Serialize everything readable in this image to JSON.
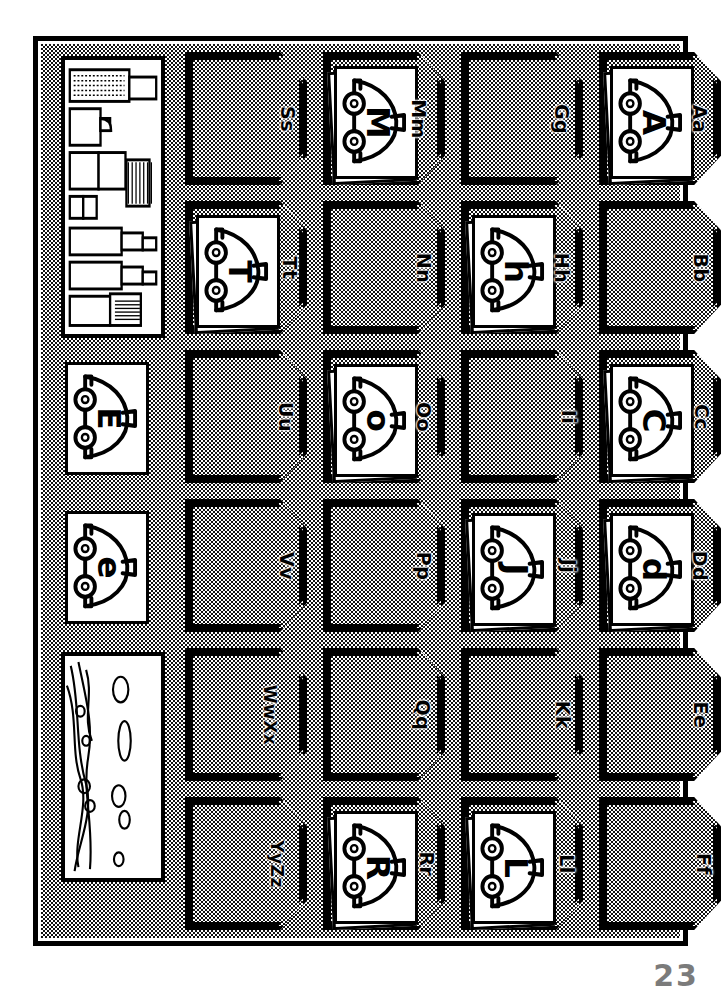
{
  "document": {
    "title": "Alphabet Pocket Chart",
    "orientation": "rotated-90",
    "page_number": "23"
  },
  "colors": {
    "ink": "#000000",
    "paper": "#ffffff",
    "felt_texture": "halftone-stipple"
  },
  "chart": {
    "rows": 6,
    "columns": 5,
    "columns_desc": [
      "illustration-column",
      "letters-S-to-Z",
      "letters-M-to-R",
      "letters-G-to-L",
      "letters-A-to-F"
    ]
  },
  "illustrations": [
    {
      "name": "bookshelf-supplies-panel",
      "position": "column-1-row-1",
      "description": "shelf with books and supplies"
    },
    {
      "name": "landscape-trees-panel",
      "position": "column-1-row-5",
      "description": "trees and bushes landscape"
    }
  ],
  "free_cards": [
    {
      "letter": "E",
      "position": "column-1-row-3"
    },
    {
      "letter": "e",
      "position": "column-1-row-4"
    }
  ],
  "pockets": [
    {
      "label": "Ss",
      "col": 4,
      "row": 1,
      "card": null
    },
    {
      "label": "Tt",
      "col": 4,
      "row": 2,
      "card": "T"
    },
    {
      "label": "Uu",
      "col": 4,
      "row": 3,
      "card": null
    },
    {
      "label": "Vv",
      "col": 4,
      "row": 4,
      "card": null
    },
    {
      "label": "WwXx",
      "col": 4,
      "row": 5,
      "card": null
    },
    {
      "label": "YyZz",
      "col": 4,
      "row": 6,
      "card": null
    },
    {
      "label": "Mm",
      "col": 3,
      "row": 1,
      "card": "M"
    },
    {
      "label": "Nn",
      "col": 3,
      "row": 2,
      "card": null
    },
    {
      "label": "Oo",
      "col": 3,
      "row": 3,
      "card": "o"
    },
    {
      "label": "Pp",
      "col": 3,
      "row": 4,
      "card": null
    },
    {
      "label": "Qq",
      "col": 3,
      "row": 5,
      "card": null
    },
    {
      "label": "Rr",
      "col": 3,
      "row": 6,
      "card": "R"
    },
    {
      "label": "Gg",
      "col": 2,
      "row": 1,
      "card": null
    },
    {
      "label": "Hh",
      "col": 2,
      "row": 2,
      "card": "h"
    },
    {
      "label": "Ii",
      "col": 2,
      "row": 3,
      "card": null
    },
    {
      "label": "Jj",
      "col": 2,
      "row": 4,
      "card": "J"
    },
    {
      "label": "Kk",
      "col": 2,
      "row": 5,
      "card": null
    },
    {
      "label": "Ll",
      "col": 2,
      "row": 6,
      "card": "L"
    },
    {
      "label": "Aa",
      "col": 1,
      "row": 1,
      "card": "A"
    },
    {
      "label": "Bb",
      "col": 1,
      "row": 2,
      "card": null
    },
    {
      "label": "Cc",
      "col": 1,
      "row": 3,
      "card": "C"
    },
    {
      "label": "Dd",
      "col": 1,
      "row": 4,
      "card": "d"
    },
    {
      "label": "Ee",
      "col": 1,
      "row": 5,
      "card": null
    },
    {
      "label": "Ff",
      "col": 1,
      "row": 6,
      "card": null
    }
  ]
}
